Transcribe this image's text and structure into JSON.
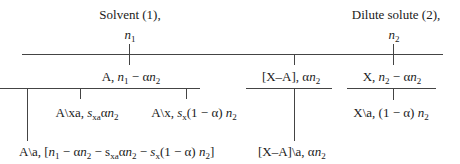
{
  "diagram": {
    "top": {
      "solvent_label": "Solvent (1),",
      "solvent_amount_var": "n",
      "solvent_amount_sub": "1",
      "solute_label": "Dilute solute (2),",
      "solute_amount_var": "n",
      "solute_amount_sub": "2"
    },
    "level2": {
      "a_free": {
        "prefix": "A, ",
        "expr_1": "n",
        "sub_1": "1",
        "op": " − α",
        "expr_2": "n",
        "sub_2": "2"
      },
      "complex": {
        "prefix": "[X–A], α",
        "expr": "n",
        "sub": "2"
      },
      "x_free": {
        "prefix": "X, ",
        "expr_1": "n",
        "sub_1": "2",
        "op": " − α",
        "expr_2": "n",
        "sub_2": "2"
      }
    },
    "level3": {
      "a_xa": {
        "prefix": "A\\xa, ",
        "s": "s",
        "s_sub": "xa",
        "mid": "α",
        "n": "n",
        "n_sub": "2"
      },
      "a_x": {
        "prefix": "A\\x, ",
        "s": "s",
        "s_sub": "x",
        "mid": "(1 − α) ",
        "n": "n",
        "n_sub": "2"
      },
      "x_a": {
        "prefix": "X\\a, (1 − α) ",
        "n": "n",
        "n_sub": "2"
      }
    },
    "level4": {
      "a_a": {
        "prefix": "A\\a, [",
        "n1": "n",
        "n1_sub": "1",
        "t1": " − α",
        "n2": "n",
        "n2_sub": "2",
        "t2": " − s",
        "sxa_sub": "xa",
        "t3": "α",
        "n3": "n",
        "n3_sub": "2",
        "t4": " − ",
        "s": "s",
        "sx_sub": "x",
        "t5": "(1 − α) ",
        "n4": "n",
        "n4_sub": "2",
        "suffix": "]"
      },
      "complex_a": {
        "prefix": "[X–A]\\a, α",
        "n": "n",
        "n_sub": "2"
      }
    }
  }
}
